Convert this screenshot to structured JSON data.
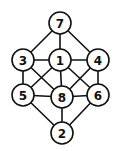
{
  "diagram": {
    "type": "graph",
    "nodes": [
      {
        "id": "7",
        "label": "7",
        "x": 60,
        "y": 23
      },
      {
        "id": "3",
        "label": "3",
        "x": 23,
        "y": 60
      },
      {
        "id": "1",
        "label": "1",
        "x": 60,
        "y": 60
      },
      {
        "id": "4",
        "label": "4",
        "x": 98,
        "y": 60
      },
      {
        "id": "5",
        "label": "5",
        "x": 23,
        "y": 95
      },
      {
        "id": "8",
        "label": "8",
        "x": 62,
        "y": 97
      },
      {
        "id": "6",
        "label": "6",
        "x": 98,
        "y": 95
      },
      {
        "id": "2",
        "label": "2",
        "x": 62,
        "y": 133
      }
    ],
    "edges": [
      [
        "7",
        "3"
      ],
      [
        "7",
        "1"
      ],
      [
        "7",
        "4"
      ],
      [
        "3",
        "1"
      ],
      [
        "1",
        "4"
      ],
      [
        "3",
        "5"
      ],
      [
        "3",
        "8"
      ],
      [
        "1",
        "5"
      ],
      [
        "1",
        "8"
      ],
      [
        "1",
        "6"
      ],
      [
        "4",
        "8"
      ],
      [
        "4",
        "6"
      ],
      [
        "5",
        "8"
      ],
      [
        "8",
        "6"
      ],
      [
        "5",
        "2"
      ],
      [
        "8",
        "2"
      ],
      [
        "6",
        "2"
      ]
    ]
  }
}
